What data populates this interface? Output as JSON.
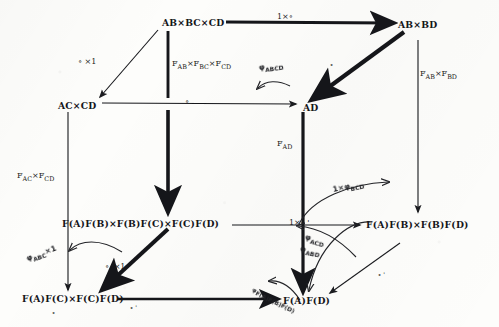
{
  "diagram": {
    "type": "commutative-diagram",
    "ink_color": "#15161a",
    "paper_color": "#fdfdfb",
    "nodes": [
      {
        "id": "ab_bc_cd",
        "label": "AB×BC×CD",
        "x": 162,
        "y": 18
      },
      {
        "id": "ab_bd",
        "label": "AB×BD",
        "x": 398,
        "y": 20
      },
      {
        "id": "ac_cd",
        "label": "AC×CD",
        "x": 58,
        "y": 101
      },
      {
        "id": "ad",
        "label": "AD",
        "x": 303,
        "y": 103
      },
      {
        "id": "fafb_fbfc_fcfd",
        "label": "F(A)F(B)×F(B)F(C)×F(C)F(D)",
        "x": 62,
        "y": 219
      },
      {
        "id": "fafb_fbfd",
        "label": "F(A)F(B)×F(B)F(D)",
        "x": 366,
        "y": 220
      },
      {
        "id": "fafc_fcfd",
        "label": "F(A)F(C)×F(C)F(D)",
        "x": 22,
        "y": 294
      },
      {
        "id": "fafd",
        "label": "F(A)F(D)",
        "x": 283,
        "y": 296
      }
    ],
    "edge_labels": [
      {
        "id": "top_1_comp",
        "text": "1×∘",
        "x": 277,
        "y": 13,
        "style": "math"
      },
      {
        "id": "comp_x1_left",
        "text": "∘ ×1",
        "x": 78,
        "y": 58,
        "style": "math"
      },
      {
        "id": "fab_fbc_fcd",
        "html": "F<sub>AB</sub>×F<sub>BC</sub>×F<sub>CD</sub>",
        "x": 172,
        "y": 60,
        "style": "math"
      },
      {
        "id": "fab_fbd",
        "html": "F<sub>AB</sub>×F<sub>BD</sub>",
        "x": 420,
        "y": 70,
        "style": "math"
      },
      {
        "id": "mid_comp",
        "text": "∘",
        "x": 185,
        "y": 98,
        "style": "math"
      },
      {
        "id": "fad",
        "html": "F<sub>AD</sub>",
        "x": 277,
        "y": 140,
        "style": "math"
      },
      {
        "id": "fac_fcd",
        "html": "F<sub>AC</sub>×F<sub>CD</sub>",
        "x": 17,
        "y": 172,
        "style": "math"
      },
      {
        "id": "diag_comp_x1",
        "text": "∘ '×1",
        "x": 105,
        "y": 263,
        "style": "math"
      },
      {
        "id": "one_x_comp",
        "text": "1×∘ '",
        "x": 289,
        "y": 219,
        "style": "math"
      },
      {
        "id": "bottom_comp",
        "text": "∘ '",
        "x": 130,
        "y": 305,
        "style": "math"
      },
      {
        "id": "diag_comp_right",
        "text": "∘ '",
        "x": 378,
        "y": 272,
        "style": "math"
      },
      {
        "id": "diag_comp_ne",
        "text": "∘",
        "x": 330,
        "y": 62,
        "style": "math"
      },
      {
        "id": "comp_tail_left",
        "text": "∘",
        "x": 52,
        "y": 310,
        "style": "math"
      }
    ],
    "hand_labels": [
      {
        "id": "phi_abcd",
        "html": "φ<sub>ABCD</sub>",
        "x": 259,
        "y": 64,
        "rot": "rot-n8"
      },
      {
        "id": "phi_bcd",
        "html": "1×φ<sub>BCD</sub>",
        "x": 333,
        "y": 186,
        "rot": "rot-n12"
      },
      {
        "id": "phi_abc_x1",
        "html": "φ<sub>ABC</sub>×1",
        "x": 27,
        "y": 255,
        "rot": "rot-n20"
      },
      {
        "id": "phi_acd",
        "html": "φ<sub>ACD</sub>",
        "x": 305,
        "y": 233,
        "rot": "rot-p16"
      },
      {
        "id": "phi_abd",
        "html": "φ<sub>ABD</sub>",
        "x": 300,
        "y": 245,
        "rot": "rot-p10"
      },
      {
        "id": "phi_fafbfcfd",
        "html": "φ<sub>F(A)F(B)F(D)</sub>",
        "x": 252,
        "y": 287,
        "rot": "rot-p26"
      }
    ]
  }
}
